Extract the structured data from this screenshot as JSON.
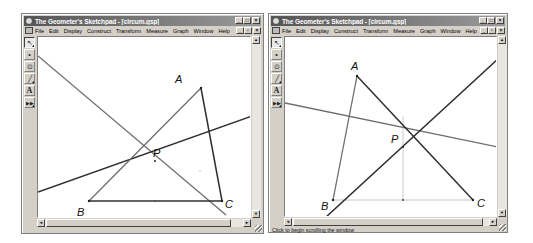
{
  "windows": [
    {
      "id": "left",
      "title": "The Geometer's Sketchpad - [circum.gsp]",
      "menus": [
        "File",
        "Edit",
        "Display",
        "Construct",
        "Transform",
        "Measure",
        "Graph",
        "Window",
        "Help"
      ],
      "window_buttons": {
        "minimize": "_",
        "maximize": "□",
        "close": "×"
      },
      "doc_buttons": {
        "minimize": "_",
        "restore": "▫",
        "close": "×"
      },
      "tools": [
        {
          "name": "selection-arrow-tool",
          "glyph": "↖",
          "active": true
        },
        {
          "name": "point-tool",
          "glyph": "•"
        },
        {
          "name": "compass-tool",
          "glyph": "⊙"
        },
        {
          "name": "straightedge-tool",
          "glyph": "╱"
        },
        {
          "name": "text-tool",
          "glyph": "A"
        },
        {
          "name": "custom-tool",
          "glyph": "▶▶"
        }
      ],
      "status": "",
      "points": {
        "A": {
          "label": "A",
          "x": 163,
          "y": 51
        },
        "B": {
          "label": "B",
          "x": 51,
          "y": 164
        },
        "C": {
          "label": "C",
          "x": 184,
          "y": 164
        },
        "P": {
          "label": "P",
          "x": 115,
          "y": 127
        }
      }
    },
    {
      "id": "right",
      "title": "The Geometer's Sketchpad - [circum.gsp]",
      "menus": [
        "File",
        "Edit",
        "Display",
        "Construct",
        "Transform",
        "Measure",
        "Graph",
        "Window",
        "Help"
      ],
      "window_buttons": {
        "minimize": "_",
        "maximize": "□",
        "close": "×"
      },
      "doc_buttons": {
        "minimize": "_",
        "restore": "▫",
        "close": "×"
      },
      "tools": [
        {
          "name": "selection-arrow-tool",
          "glyph": "↖",
          "active": true
        },
        {
          "name": "point-tool",
          "glyph": "•"
        },
        {
          "name": "compass-tool",
          "glyph": "⊙"
        },
        {
          "name": "straightedge-tool",
          "glyph": "╱"
        },
        {
          "name": "text-tool",
          "glyph": "A"
        },
        {
          "name": "custom-tool",
          "glyph": "▶▶"
        }
      ],
      "status": "Click to begin scrolling the window",
      "points": {
        "A": {
          "label": "A",
          "x": 72,
          "y": 39
        },
        "B": {
          "label": "B",
          "x": 48,
          "y": 163
        },
        "C": {
          "label": "C",
          "x": 188,
          "y": 163
        },
        "P": {
          "label": "P",
          "x": 118,
          "y": 112
        }
      }
    }
  ],
  "scroll_arrows": {
    "up": "▲",
    "down": "▼",
    "left": "◄",
    "right": "►"
  },
  "colors": {
    "titlebar_start": "#555555",
    "titlebar_end": "#9a9a9a",
    "chrome": "#d4d0c8",
    "canvas": "#ffffff",
    "dark_line": "#333333",
    "gray_line": "#777777",
    "faint_line": "#bbbbbb"
  }
}
